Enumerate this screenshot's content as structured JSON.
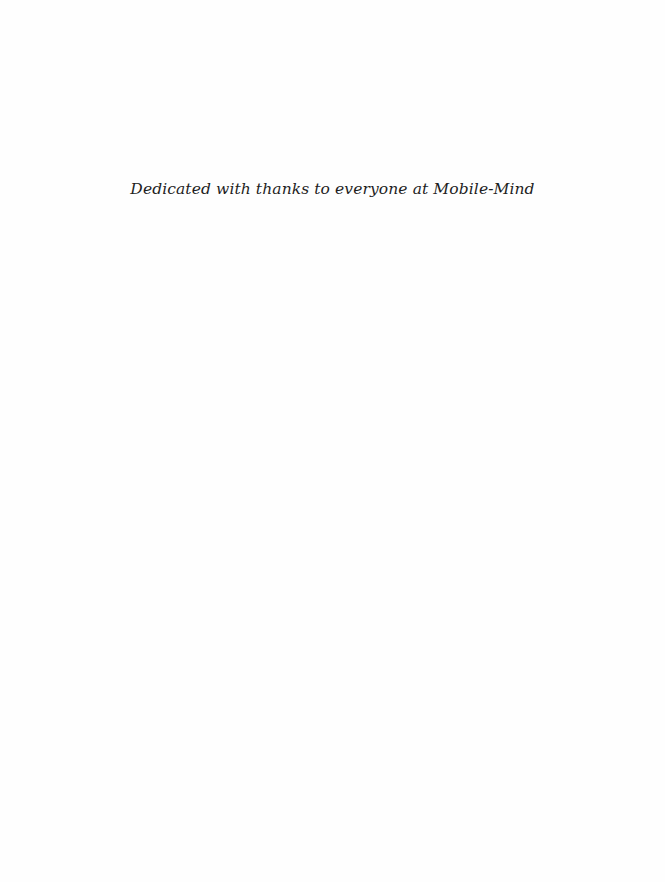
{
  "page": {
    "dedication": "Dedicated with thanks to everyone at Mobile-Mind"
  }
}
